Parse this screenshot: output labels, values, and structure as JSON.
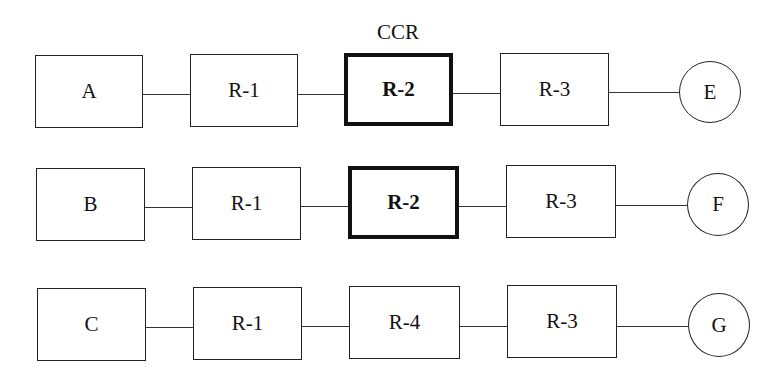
{
  "diagram": {
    "annotation": "CCR",
    "rows": [
      {
        "source": "A",
        "steps": [
          "R-1",
          "R-2",
          "R-3"
        ],
        "sink": "E",
        "highlight_index": 1
      },
      {
        "source": "B",
        "steps": [
          "R-1",
          "R-2",
          "R-3"
        ],
        "sink": "F",
        "highlight_index": 1
      },
      {
        "source": "C",
        "steps": [
          "R-1",
          "R-4",
          "R-3"
        ],
        "sink": "G",
        "highlight_index": null
      }
    ]
  }
}
